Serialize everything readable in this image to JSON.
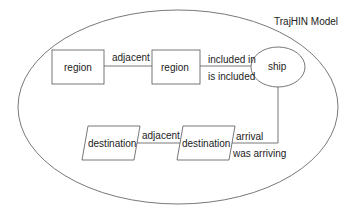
{
  "diagram": {
    "title": "TrajHIN Model",
    "nodes": [
      {
        "id": "region1",
        "label": "region",
        "shape": "rectangle"
      },
      {
        "id": "region2",
        "label": "region",
        "shape": "rectangle"
      },
      {
        "id": "ship",
        "label": "ship",
        "shape": "ellipse"
      },
      {
        "id": "dest1",
        "label": "destination",
        "shape": "parallelogram"
      },
      {
        "id": "dest2",
        "label": "destination",
        "shape": "parallelogram"
      }
    ],
    "edges": [
      {
        "from": "region1",
        "to": "region2",
        "label": "adjacent"
      },
      {
        "from": "region2",
        "to": "ship",
        "label_top": "included in",
        "label_bottom": "is included"
      },
      {
        "from": "dest1",
        "to": "dest2",
        "label": "adjacent"
      },
      {
        "from": "dest2",
        "to": "ship",
        "label_top": "arrival",
        "label_bottom": "was arriving"
      }
    ]
  }
}
